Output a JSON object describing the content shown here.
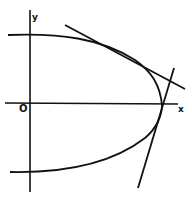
{
  "diagram": {
    "labels": {
      "y_axis": "y",
      "x_axis": "x",
      "origin": "O"
    },
    "colors": {
      "background": "#ffffff",
      "ink": "#111111"
    },
    "elements": [
      {
        "name": "y-axis",
        "type": "line"
      },
      {
        "name": "x-axis",
        "type": "line"
      },
      {
        "name": "curve",
        "type": "closed-ended curve (upper and lower branches meeting near x-axis on right)"
      },
      {
        "name": "tangent-line-upper",
        "type": "line"
      },
      {
        "name": "tangent-line-lower",
        "type": "line"
      }
    ]
  }
}
